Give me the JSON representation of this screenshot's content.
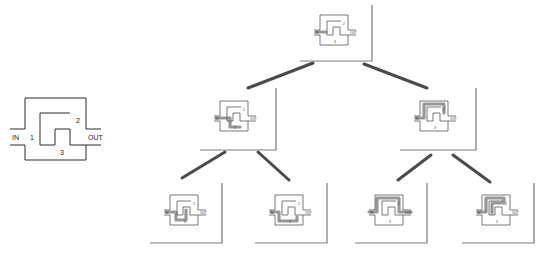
{
  "reference_circuit": {
    "labels": {
      "in": "IN",
      "out": "OUT",
      "path1": "1",
      "path2": "2",
      "path3": "3"
    }
  },
  "tree": {
    "nodes": [
      {
        "id": "root",
        "level": 0,
        "highlight": "in-stub",
        "label_in": "IN",
        "label_out": "OUT",
        "label_2": "2",
        "label_3": "3"
      },
      {
        "id": "l1-left",
        "level": 1,
        "highlight": "path-1-3-partial",
        "label_in": "IN",
        "label_out": "OUT",
        "label_2": "2",
        "label_3": "3"
      },
      {
        "id": "l1-right",
        "level": 1,
        "highlight": "path-2-top",
        "label_in": "IN",
        "label_out": "OUT",
        "label_2": "2",
        "label_3": "3"
      },
      {
        "id": "l2-a",
        "level": 2,
        "highlight": "path-1-notch",
        "label_in": "IN",
        "label_out": "OUT",
        "label_2": "2",
        "label_3": "3"
      },
      {
        "id": "l2-b",
        "level": 2,
        "highlight": "path-3-bottom",
        "label_in": "IN",
        "label_out": "OUT",
        "label_2": "2",
        "label_3": "3"
      },
      {
        "id": "l2-c",
        "level": 2,
        "highlight": "path-2-full",
        "label_in": "IN",
        "label_out": "OUT",
        "label_2": "2",
        "label_3": "3"
      },
      {
        "id": "l2-d",
        "level": 2,
        "highlight": "path-2-inner",
        "label_in": "IN",
        "label_out": "OUT",
        "label_2": "2",
        "label_3": "3"
      }
    ],
    "edges": [
      {
        "from": "root",
        "to": "l1-left"
      },
      {
        "from": "root",
        "to": "l1-right"
      },
      {
        "from": "l1-left",
        "to": "l2-a"
      },
      {
        "from": "l1-left",
        "to": "l2-b"
      },
      {
        "from": "l1-right",
        "to": "l2-c"
      },
      {
        "from": "l1-right",
        "to": "l2-d"
      }
    ]
  }
}
